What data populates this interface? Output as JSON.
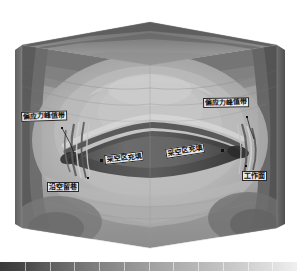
{
  "figure": {
    "kind": "3d-contour-block-model",
    "background": "#ffffff"
  },
  "annotations": [
    {
      "id": "peak-stress-left",
      "label": "偏应力峰值带",
      "x": 21,
      "y": 113,
      "rotate": -2,
      "marker_x": 62,
      "marker_y": 128,
      "leader": "M62,128 L70,143 L74,153"
    },
    {
      "id": "peak-stress-right",
      "label": "偏应力峰值带",
      "x": 204,
      "y": 99,
      "rotate": -1,
      "marker_x": 247,
      "marker_y": 117,
      "leader": "M247,117 L250,128 L254,138"
    },
    {
      "id": "goaf-fill-left",
      "label": "采空区充填",
      "x": 106,
      "y": 156,
      "rotate": -5,
      "marker_x": 101,
      "marker_y": 160,
      "leader": ""
    },
    {
      "id": "goaf-fill-right",
      "label": "采空区充填",
      "x": 166,
      "y": 150,
      "rotate": -8,
      "marker_x": 222,
      "marker_y": 150,
      "leader": ""
    },
    {
      "id": "gob-side-entry",
      "label": "沿空留巷",
      "x": 47,
      "y": 183,
      "rotate": 0,
      "marker_x": 88,
      "marker_y": 178,
      "leader": ""
    },
    {
      "id": "working-face",
      "label": "工作面",
      "x": 243,
      "y": 172,
      "rotate": 0,
      "marker_x": 246,
      "marker_y": 166,
      "leader": ""
    }
  ],
  "chart_data": {
    "type": "heatmap",
    "title": "",
    "xlabel": "",
    "ylabel": "",
    "colormap": "grayscale",
    "legend_position": "bottom",
    "grid": false,
    "colorbar": {
      "orientation": "horizontal",
      "ticks": 12,
      "stops": [
        {
          "pos": 0.0,
          "color": "#3a3a3a"
        },
        {
          "pos": 0.06,
          "color": "#434343"
        },
        {
          "pos": 0.14,
          "color": "#585858"
        },
        {
          "pos": 0.24,
          "color": "#6e6e6e"
        },
        {
          "pos": 0.34,
          "color": "#828282"
        },
        {
          "pos": 0.44,
          "color": "#949494"
        },
        {
          "pos": 0.54,
          "color": "#a6a6a6"
        },
        {
          "pos": 0.64,
          "color": "#b4b4b4"
        },
        {
          "pos": 0.74,
          "color": "#c2c2c2"
        },
        {
          "pos": 0.84,
          "color": "#d2d2d2"
        },
        {
          "pos": 0.92,
          "color": "#e0e0e0"
        },
        {
          "pos": 1.0,
          "color": "#f0f0f0"
        }
      ]
    },
    "contour_levels": [
      {
        "name": "level-1",
        "gray": "#3c3c3c"
      },
      {
        "name": "level-2",
        "gray": "#4b4b4b"
      },
      {
        "name": "level-3",
        "gray": "#5a5a5a"
      },
      {
        "name": "level-4",
        "gray": "#696969"
      },
      {
        "name": "level-5",
        "gray": "#787878"
      },
      {
        "name": "level-6",
        "gray": "#878787"
      },
      {
        "name": "level-7",
        "gray": "#969696"
      },
      {
        "name": "level-8",
        "gray": "#a4a4a4"
      },
      {
        "name": "level-9",
        "gray": "#b2b2b2"
      },
      {
        "name": "level-10",
        "gray": "#c0c0c0"
      },
      {
        "name": "level-11",
        "gray": "#cecece"
      },
      {
        "name": "level-12",
        "gray": "#dcdcdc"
      }
    ]
  }
}
